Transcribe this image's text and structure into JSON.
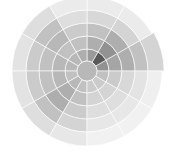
{
  "chart_data": {
    "type": "heatmap",
    "subtype": "polar",
    "title": "",
    "center": [
      87,
      71
    ],
    "center_radius": 10,
    "center_value": 0.35,
    "ring_radii": [
      10,
      22,
      35,
      48,
      61,
      75
    ],
    "sector_start_degrees": [
      0,
      30,
      60,
      90,
      120,
      150,
      180,
      210,
      240,
      270,
      300,
      330
    ],
    "angle_convention": "degrees counterclockwise from east",
    "values": [
      [
        0.55,
        0.45,
        0.4,
        0.3,
        0.2
      ],
      [
        0.85,
        0.55,
        0.4,
        0.2,
        0.08
      ],
      [
        0.5,
        0.4,
        0.3,
        0.18,
        0.08
      ],
      [
        0.4,
        0.3,
        0.25,
        0.15,
        0.08
      ],
      [
        0.35,
        0.3,
        0.35,
        0.3,
        0.15
      ],
      [
        0.35,
        0.35,
        0.3,
        0.25,
        0.12
      ],
      [
        0.3,
        0.35,
        0.3,
        0.25,
        0.12
      ],
      [
        0.35,
        0.4,
        0.4,
        0.3,
        0.15
      ],
      [
        0.3,
        0.3,
        0.25,
        0.2,
        0.1
      ],
      [
        0.25,
        0.2,
        0.15,
        0.1,
        0.05
      ],
      [
        0.25,
        0.2,
        0.15,
        0.1,
        0.05
      ],
      [
        0.3,
        0.25,
        0.18,
        0.12,
        0.06
      ]
    ],
    "outer_extension": {
      "sector_start": 0,
      "radius": 77
    },
    "colormap": "grayscale (white=low, black=high)",
    "grid": true,
    "legend": "none",
    "xlabel": "",
    "ylabel": ""
  }
}
